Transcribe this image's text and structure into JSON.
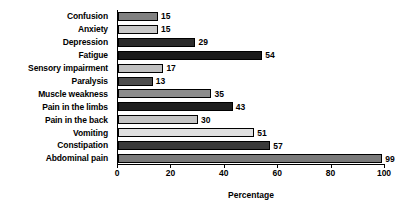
{
  "chart_data": {
    "type": "bar",
    "orientation": "horizontal",
    "title": "",
    "xlabel": "Percentage",
    "ylabel": "",
    "xlim": [
      0,
      100
    ],
    "ylim": null,
    "grid": false,
    "legend": null,
    "xticks": [
      0,
      20,
      40,
      60,
      80,
      100
    ],
    "xtick_labels": [
      "0",
      "20",
      "40",
      "60",
      "80",
      "100"
    ],
    "categories": [
      "Confusion",
      "Anxiety",
      "Depression",
      "Fatigue",
      "Sensory impairment",
      "Paralysis",
      "Muscle weakness",
      "Pain in the limbs",
      "Pain in the back",
      "Vomiting",
      "Constipation",
      "Abdominal pain"
    ],
    "values": [
      15,
      15,
      29,
      54,
      17,
      13,
      35,
      43,
      30,
      51,
      57,
      99
    ],
    "value_labels": [
      "15",
      "15",
      "29",
      "54",
      "17",
      "13",
      "35",
      "43",
      "30",
      "51",
      "57",
      "99"
    ],
    "bar_colors": [
      "#808080",
      "#c8c8c8",
      "#2b2b2b",
      "#1a1a1a",
      "#c0c0c0",
      "#4d4d4d",
      "#8c8c8c",
      "#1f1f1f",
      "#c4c4c4",
      "#e0e0e0",
      "#3a3a3a",
      "#7a7a7a"
    ]
  },
  "axis": {
    "line_color": "#000000"
  }
}
